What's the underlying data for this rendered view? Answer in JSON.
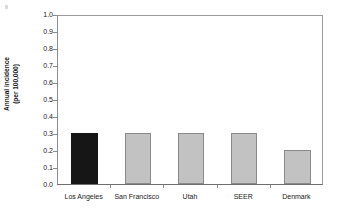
{
  "chart_data": {
    "type": "bar",
    "title": "",
    "subtitle": "",
    "xlabel": "",
    "ylabel": "Annual incidence (per 100,000)",
    "ylabel_line1": "Annual incidence",
    "ylabel_line2": "(per 100,000)",
    "categories": [
      "Los Angeles",
      "San Francisco",
      "Utah",
      "SEER",
      "Denmark"
    ],
    "values": [
      0.3,
      0.3,
      0.3,
      0.3,
      0.2
    ],
    "ylim": [
      0.0,
      1.0
    ],
    "ytick_values": [
      1.0,
      0.9,
      0.8,
      0.7,
      0.6,
      0.5,
      0.4,
      0.3,
      0.2,
      0.1,
      0.0
    ],
    "ytick_labels": [
      "1.0",
      "0.9",
      "0.8",
      "0.7",
      "0.6",
      "0.5",
      "0.4",
      "0.3",
      "0.2",
      "0.1",
      "0.0"
    ],
    "grid": false,
    "legend": "none",
    "bar_colors": [
      "#161616",
      "#c2c2c2",
      "#c2c2c2",
      "#c2c2c2",
      "#c2c2c2"
    ],
    "highlight_category": "Los Angeles",
    "highlight_color": "#161616",
    "series_color": "#c2c2c2",
    "bar_border_color": "#8a8a8a",
    "axis_color": "#8c8c8c",
    "background_color": "#ffffff"
  }
}
